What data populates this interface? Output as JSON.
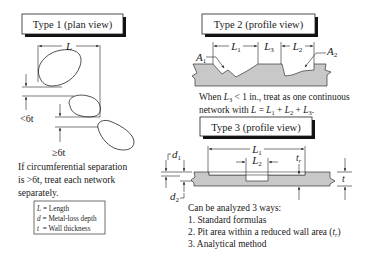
{
  "type1": {
    "title": "Type 1 (plan view)",
    "dim_L": "L",
    "label_lt6t": "<6t",
    "label_ge6t": "≥6t",
    "note_lines": [
      "If circumferential separation",
      "is >6t, treat each network",
      "separately."
    ]
  },
  "legend": {
    "items": [
      {
        "symbol": "L",
        "text": "= Length"
      },
      {
        "symbol": "d",
        "text": "= Metal-loss depth"
      },
      {
        "symbol": "t",
        "text": " = Wall thickness"
      }
    ]
  },
  "type2": {
    "title": "Type 2 (profile view)",
    "labels": {
      "A1": "A",
      "A1_sub": "1",
      "A2": "A",
      "A2_sub": "2",
      "L1": "L",
      "L1_sub": "1",
      "L2": "L",
      "L2_sub": "2",
      "L3": "L",
      "L3_sub": "3"
    },
    "note_lines": [
      "When L3 < 1 in., treat as one continuous",
      "network with L = L1 + L2 + L3."
    ]
  },
  "type3": {
    "title": "Type 3 (profile view)",
    "labels": {
      "d1": "d",
      "d1_sub": "1",
      "d2": "d",
      "d2_sub": "2",
      "L1": "L",
      "L1_sub": "1",
      "L2": "L",
      "L2_sub": "2",
      "tr": "t",
      "tr_sub": "r",
      "t": "t"
    },
    "methods_heading": "Can be analyzed 3 ways:",
    "methods": [
      "1. Standard formulas",
      "2. Pit area within a reduced wall area (tr)",
      "3. Analytical method"
    ]
  },
  "colors": {
    "metal_fill": "#c8c8c8",
    "line": "#222222",
    "background": "#ffffff"
  }
}
